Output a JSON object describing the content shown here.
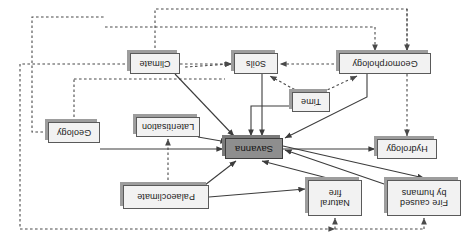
{
  "figure": {
    "orientation": "rotated-180",
    "type": "flow-diagram",
    "background": "#ffffff",
    "central_node_color": "#8e8e8e",
    "node_color": "#f2f2f2",
    "border_color": "#5a5a5a",
    "line_color": "#3c3c3c"
  },
  "nodes": [
    {
      "id": "fire_humans",
      "label": "Fire caused\nby humans",
      "x": 14,
      "y": 33,
      "w": 74,
      "h": 36,
      "central": false
    },
    {
      "id": "natural_fire",
      "label": "Natural\nfire",
      "x": 113,
      "y": 33,
      "w": 54,
      "h": 36,
      "central": false
    },
    {
      "id": "palaeoclimate",
      "label": "Palaeoclimate",
      "x": 266,
      "y": 40,
      "w": 86,
      "h": 24,
      "central": false
    },
    {
      "id": "hydrology",
      "label": "Hydrology",
      "x": 38,
      "y": 90,
      "w": 60,
      "h": 20,
      "central": false
    },
    {
      "id": "savanna",
      "label": "Savanna",
      "x": 192,
      "y": 90,
      "w": 58,
      "h": 21,
      "central": true
    },
    {
      "id": "lateritisation",
      "label": "Lateritisation",
      "x": 275,
      "y": 112,
      "w": 64,
      "h": 20,
      "central": false
    },
    {
      "id": "geology",
      "label": "Geology",
      "x": 375,
      "y": 106,
      "w": 52,
      "h": 21,
      "central": false
    },
    {
      "id": "time",
      "label": "Time",
      "x": 145,
      "y": 137,
      "w": 38,
      "h": 20,
      "central": false
    },
    {
      "id": "geomorphology",
      "label": "Geomorphology",
      "x": 44,
      "y": 175,
      "w": 92,
      "h": 21,
      "central": false
    },
    {
      "id": "soils",
      "label": "Soils",
      "x": 197,
      "y": 175,
      "w": 44,
      "h": 21,
      "central": false
    },
    {
      "id": "climate",
      "label": "Climate",
      "x": 295,
      "y": 175,
      "w": 50,
      "h": 21,
      "central": false
    }
  ],
  "edges": [
    {
      "from": "palaeoclimate",
      "to": "savanna",
      "style": "solid",
      "arrow": true
    },
    {
      "from": "palaeoclimate",
      "to": "natural_fire",
      "style": "solid",
      "arrow": true
    },
    {
      "from": "palaeoclimate",
      "to": "lateritisation",
      "style": "dashed",
      "arrow": true
    },
    {
      "from": "natural_fire",
      "to": "savanna",
      "style": "solid",
      "arrow": true
    },
    {
      "from": "fire_humans",
      "to": "savanna",
      "style": "solid",
      "arrow": true
    },
    {
      "from": "savanna",
      "to": "hydrology",
      "style": "solid",
      "arrow": true
    },
    {
      "from": "savanna",
      "to": "fire_humans",
      "style": "solid",
      "arrow": true
    },
    {
      "from": "geology",
      "to": "savanna",
      "style": "solid",
      "arrow": true
    },
    {
      "from": "lateritisation",
      "to": "savanna",
      "style": "solid",
      "arrow": true
    },
    {
      "from": "geology",
      "to": "soils",
      "style": "dashed",
      "arrow": true
    },
    {
      "from": "geology",
      "to": "geomorphology",
      "style": "dashed",
      "arrow": true
    },
    {
      "from": "time",
      "to": "savanna",
      "style": "solid",
      "arrow": true
    },
    {
      "from": "time",
      "to": "geomorphology",
      "style": "dashed",
      "arrow": true
    },
    {
      "from": "time",
      "to": "soils",
      "style": "dashed",
      "arrow": true
    },
    {
      "from": "geomorphology",
      "to": "savanna",
      "style": "solid",
      "arrow": true
    },
    {
      "from": "geomorphology",
      "to": "soils",
      "style": "dashed",
      "arrow": true
    },
    {
      "from": "soils",
      "to": "savanna",
      "style": "solid",
      "arrow": true
    },
    {
      "from": "climate",
      "to": "savanna",
      "style": "solid",
      "arrow": true
    },
    {
      "from": "climate",
      "to": "soils",
      "style": "dashed",
      "arrow": true
    },
    {
      "from": "climate",
      "to": "geomorphology",
      "style": "dashed",
      "arrow": true
    },
    {
      "from": "climate",
      "to": "hydrology",
      "style": "dashed",
      "arrow": true
    },
    {
      "from": "climate",
      "to": "fire_humans",
      "style": "dashed",
      "arrow": true
    },
    {
      "from": "climate",
      "to": "natural_fire",
      "style": "dashed",
      "arrow": true
    }
  ]
}
